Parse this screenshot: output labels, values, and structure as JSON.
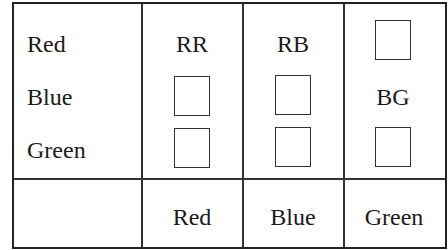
{
  "table": {
    "row_labels": [
      "Red",
      "Blue",
      "Green"
    ],
    "column_labels": [
      "Red",
      "Blue",
      "Green"
    ],
    "cells": [
      [
        "RR",
        "RB",
        ""
      ],
      [
        "",
        "",
        "BG"
      ],
      [
        "",
        "",
        ""
      ]
    ],
    "empty_cell_marker": "box"
  }
}
